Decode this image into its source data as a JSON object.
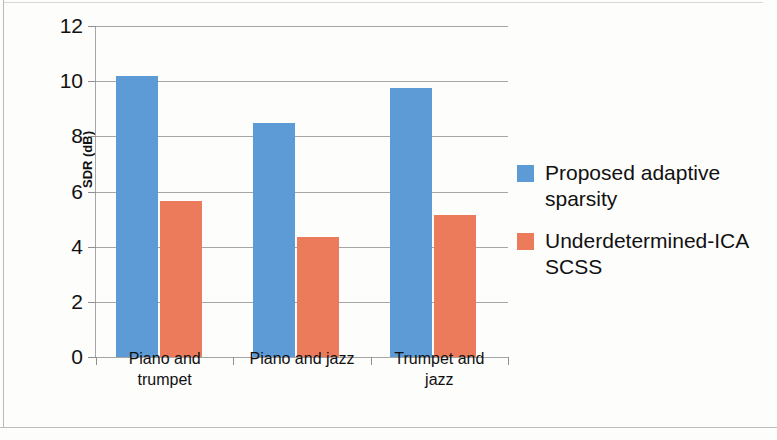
{
  "chart_data": {
    "type": "bar",
    "title": "",
    "subtitle": "",
    "xlabel": "",
    "ylabel": "SDR (dB)",
    "categories": [
      "Piano and trumpet",
      "Piano and jazz",
      "Trumpet and jazz"
    ],
    "series": [
      {
        "name": "Proposed adaptive sparsity",
        "color": "#5d9bd7",
        "values": [
          10.2,
          8.5,
          9.75
        ]
      },
      {
        "name": "Underdetermined-ICA SCSS",
        "color": "#ec7b5c",
        "values": [
          5.65,
          4.35,
          5.15
        ]
      }
    ],
    "ylim": [
      0,
      12
    ],
    "yticks": [
      0,
      2,
      4,
      6,
      8,
      10,
      12
    ],
    "yticklabels": [
      "0",
      "2",
      "4",
      "6",
      "8",
      "10",
      "12"
    ],
    "grid": "horizontal",
    "legend_position": "right"
  },
  "legend": {
    "entries": [
      {
        "label_line1": "Proposed adaptive",
        "label_line2": "sparsity"
      },
      {
        "label_line1": "Underdetermined-ICA",
        "label_line2": "SCSS"
      }
    ]
  },
  "categories_wrapped": [
    {
      "line1": "Piano and",
      "line2": "trumpet"
    },
    {
      "line1": "Piano and jazz",
      "line2": ""
    },
    {
      "line1": "Trumpet and",
      "line2": "jazz"
    }
  ]
}
